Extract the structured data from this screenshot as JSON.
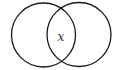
{
  "diagram": {
    "type": "venn",
    "sets": [
      {
        "name": "left-circle",
        "cx": 43.5,
        "cy": 35,
        "r": 32
      },
      {
        "name": "right-circle",
        "cx": 79,
        "cy": 34.5,
        "r": 32
      }
    ],
    "intersection_label": "x",
    "stroke_color": "#1a1a1a",
    "background": "#ffffff"
  }
}
